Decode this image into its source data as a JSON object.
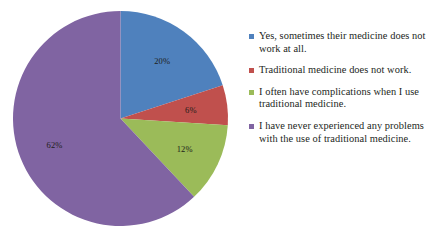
{
  "chart_data": {
    "type": "pie",
    "title": "",
    "subtitle": "",
    "xlabel": "",
    "ylabel": "",
    "grid": false,
    "legend_position": "right",
    "start_angle_deg": 0,
    "direction": "clockwise",
    "categories": [
      "Yes, sometimes their medicine does not work at all.",
      "Traditional medicine does not work.",
      "I often have complications when I use traditional medicine.",
      "I have never experienced any problems with the use of traditional medicine."
    ],
    "values": [
      20,
      6,
      12,
      62
    ],
    "data_labels": [
      "20%",
      "6%",
      "12%",
      "62%"
    ],
    "colors": [
      "#4f81bd",
      "#c0504d",
      "#9bbb59",
      "#8064a2"
    ],
    "slices": [
      {
        "label": "Yes, sometimes their medicine does not work at all.",
        "value": 20,
        "data_label": "20%",
        "color": "#4f81bd"
      },
      {
        "label": "Traditional medicine does not work.",
        "value": 6,
        "data_label": "6%",
        "color": "#c0504d"
      },
      {
        "label": "I often have complications when I use traditional medicine.",
        "value": 12,
        "data_label": "12%",
        "color": "#9bbb59"
      },
      {
        "label": "I have never experienced any problems with the use of traditional medicine.",
        "value": 62,
        "data_label": "62%",
        "color": "#8064a2"
      }
    ]
  },
  "legend": {
    "items": [
      {
        "color": "#4f81bd",
        "line1": "Yes, sometimes their medicine",
        "line2": "does not work at all."
      },
      {
        "color": "#c0504d",
        "line1": "Traditional medicine does not work.",
        "line2": ""
      },
      {
        "color": "#9bbb59",
        "line1": "I often have complications when",
        "line2": "I use traditional medicine."
      },
      {
        "color": "#8064a2",
        "line1": "I have never experienced any",
        "line2": "problems with the use of",
        "line3": "traditional medicine."
      }
    ]
  }
}
